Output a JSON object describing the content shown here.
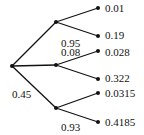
{
  "tree": {
    "branch_labels": {
      "root_to_top": "",
      "root_to_bottom": "0.45",
      "top_to_second": "0.95",
      "middle_to_first": "0.08",
      "bottom_to_second": "0.93"
    },
    "leaves": [
      "0.01",
      "0.19",
      "0.028",
      "0.322",
      "0.0315",
      "0.4185"
    ]
  }
}
